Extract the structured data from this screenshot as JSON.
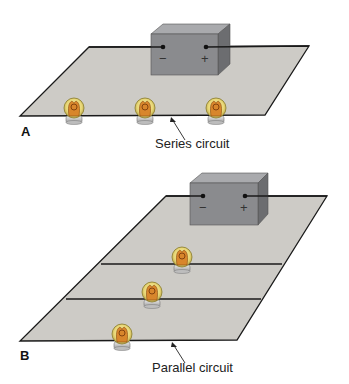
{
  "colors": {
    "plane_fill": "#cdcbc6",
    "plane_stroke": "#1a1a1a",
    "battery_front": "#8a8b8e",
    "battery_top": "#a9aaad",
    "battery_side": "#6c6d70",
    "bulb_glass": "#efe39a",
    "bulb_filament": "#c7741e",
    "bulb_base": "#cfcfcf"
  },
  "panel_a": {
    "letter": "A",
    "caption": "Series circuit",
    "battery": {
      "negative_symbol": "−",
      "positive_symbol": "+"
    },
    "bulb_count": 3
  },
  "panel_b": {
    "letter": "B",
    "caption": "Parallel circuit",
    "battery": {
      "negative_symbol": "−",
      "positive_symbol": "+"
    },
    "bulb_count": 3
  }
}
